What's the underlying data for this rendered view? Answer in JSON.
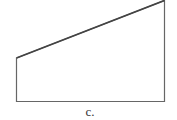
{
  "figure": {
    "label": "c.",
    "shape": "trapezoid",
    "stroke_color": "#555555",
    "vertices": [
      [
        16,
        58
      ],
      [
        164,
        0
      ],
      [
        164,
        101
      ],
      [
        16,
        101
      ]
    ]
  }
}
